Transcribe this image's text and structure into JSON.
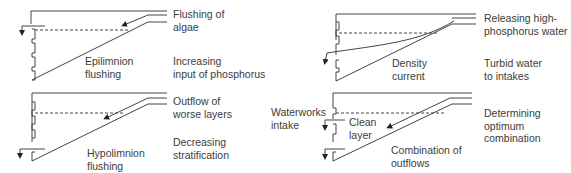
{
  "panels": [
    {
      "id": "epilimnion",
      "title_lines": [
        "Epilimnion",
        "flushing"
      ],
      "effect_lines": [
        "Flushing of",
        "algae"
      ],
      "consequence_lines": [
        "Increasing",
        "input of phosphorus"
      ]
    },
    {
      "id": "hypolimnion",
      "title_lines": [
        "Hypolimnion",
        "flushing"
      ],
      "effect_lines": [
        "Outflow of",
        "worse layers"
      ],
      "consequence_lines": [
        "Decreasing",
        "stratification"
      ]
    },
    {
      "id": "density",
      "title_lines": [
        "Density",
        "current"
      ],
      "effect_lines": [
        "Releasing high-",
        "phosphorus water"
      ],
      "consequence_lines": [
        "Turbid water",
        "to intakes"
      ]
    },
    {
      "id": "combination",
      "title_lines": [
        "Combination of",
        "outflows"
      ],
      "effect_lines": [
        "Determining",
        "optimum",
        "combination"
      ],
      "inner_label_lines": [
        "Clean",
        "layer"
      ],
      "side_label_lines": [
        "Waterworks",
        "intake"
      ]
    }
  ],
  "colors": {
    "line": "#444444",
    "text": "#3c3c3c",
    "background": "#ffffff"
  }
}
